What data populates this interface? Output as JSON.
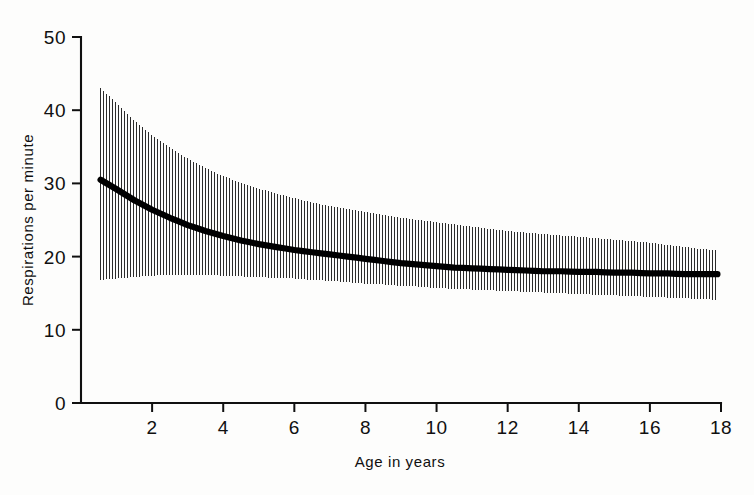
{
  "figure": {
    "background_color": "#fdfdfc",
    "ink_color": "#101010",
    "curve_color": "#000000",
    "band_color": "#2b2b2b"
  },
  "axes": {
    "y_title": "Respirations per minute",
    "x_title": "Age in years",
    "y_ticks": [
      "0",
      "10",
      "20",
      "30",
      "40",
      "50"
    ],
    "x_ticks": [
      "2",
      "4",
      "6",
      "8",
      "10",
      "12",
      "14",
      "16",
      "18"
    ]
  },
  "chart_data": {
    "type": "line",
    "title": "",
    "subtitle": "",
    "xlabel": "Age in years",
    "ylabel": "Respirations per minute",
    "xlim": [
      0,
      18
    ],
    "ylim": [
      0,
      50
    ],
    "xticks": [
      0,
      2,
      4,
      6,
      8,
      10,
      12,
      14,
      16,
      18
    ],
    "yticks": [
      0,
      10,
      20,
      30,
      40,
      50
    ],
    "grid": false,
    "legend": "none",
    "x_tick_labels_shown": [
      "2",
      "4",
      "6",
      "8",
      "10",
      "12",
      "14",
      "16",
      "18"
    ],
    "y_tick_labels_shown": [
      "0",
      "10",
      "20",
      "30",
      "40",
      "50"
    ],
    "annotations": [],
    "x": [
      0.55,
      1,
      1.5,
      2,
      2.5,
      3,
      3.5,
      4,
      4.5,
      5,
      5.5,
      6,
      6.5,
      7,
      7.5,
      8,
      8.5,
      9,
      9.5,
      10,
      10.5,
      11,
      11.5,
      12,
      12.5,
      13,
      13.5,
      14,
      14.5,
      15,
      15.5,
      16,
      16.5,
      17,
      17.5,
      17.9
    ],
    "series": [
      {
        "name": "Mean respiratory rate",
        "style": "thick-solid-line",
        "values": [
          30.5,
          29.2,
          27.7,
          26.4,
          25.3,
          24.3,
          23.5,
          22.8,
          22.2,
          21.7,
          21.3,
          20.9,
          20.6,
          20.3,
          20.0,
          19.7,
          19.4,
          19.1,
          18.9,
          18.7,
          18.5,
          18.4,
          18.3,
          18.2,
          18.1,
          18.0,
          18.0,
          17.9,
          17.9,
          17.8,
          17.8,
          17.7,
          17.7,
          17.6,
          17.6,
          17.6
        ]
      },
      {
        "name": "Upper limit of range (hatched band top)",
        "style": "vertical-hatch-boundary",
        "values": [
          43.0,
          41.0,
          38.6,
          36.6,
          34.9,
          33.4,
          32.1,
          31.0,
          30.1,
          29.3,
          28.6,
          28.0,
          27.4,
          26.9,
          26.5,
          26.1,
          25.7,
          25.3,
          25.0,
          24.7,
          24.4,
          24.1,
          23.8,
          23.5,
          23.3,
          23.1,
          22.9,
          22.7,
          22.5,
          22.3,
          22.1,
          21.9,
          21.6,
          21.3,
          21.0,
          20.9
        ]
      },
      {
        "name": "Lower limit of range (hatched band bottom)",
        "style": "vertical-hatch-boundary",
        "values": [
          16.8,
          17.0,
          17.2,
          17.4,
          17.5,
          17.5,
          17.5,
          17.4,
          17.3,
          17.2,
          17.1,
          17.0,
          16.8,
          16.7,
          16.5,
          16.3,
          16.2,
          16.0,
          15.9,
          15.7,
          15.6,
          15.5,
          15.4,
          15.3,
          15.2,
          15.1,
          15.0,
          14.9,
          14.8,
          14.7,
          14.6,
          14.5,
          14.4,
          14.3,
          14.2,
          14.1
        ]
      }
    ]
  }
}
